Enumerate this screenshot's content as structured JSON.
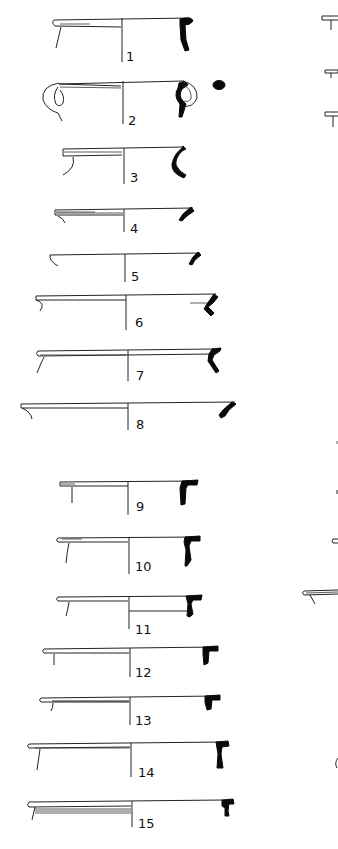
{
  "figure": {
    "type": "archaeological rim-profile plate",
    "background": "#ffffff",
    "ink": "#0a0a0a"
  },
  "profiles": [
    {
      "number": "1",
      "rim_y": 21,
      "left_x": 52,
      "axis_x": 122,
      "right_x": 192,
      "label_y": 57
    },
    {
      "number": "2",
      "rim_y": 83,
      "left_x": 58,
      "axis_x": 123,
      "right_x": 183,
      "label_y": 124,
      "has_handle": true,
      "handle_section": "oval"
    },
    {
      "number": "3",
      "rim_y": 148,
      "left_x": 62,
      "axis_x": 124,
      "right_x": 183,
      "label_y": 180
    },
    {
      "number": "4",
      "rim_y": 209,
      "left_x": 54,
      "axis_x": 124,
      "right_x": 193,
      "label_y": 230
    },
    {
      "number": "5",
      "rim_y": 254,
      "left_x": 48,
      "axis_x": 125,
      "right_x": 200,
      "label_y": 278
    },
    {
      "number": "6",
      "rim_y": 295,
      "left_x": 35,
      "axis_x": 126,
      "right_x": 217,
      "label_y": 324
    },
    {
      "number": "7",
      "rim_y": 351,
      "left_x": 36,
      "axis_x": 128,
      "right_x": 216,
      "label_y": 376
    },
    {
      "number": "8",
      "rim_y": 403,
      "left_x": 20,
      "axis_x": 128,
      "right_x": 235,
      "label_y": 426
    },
    {
      "number": "9",
      "rim_y": 481,
      "left_x": 59,
      "axis_x": 128,
      "right_x": 196,
      "label_y": 508
    },
    {
      "number": "10",
      "rim_y": 537,
      "left_x": 57,
      "axis_x": 129,
      "right_x": 199,
      "label_y": 568
    },
    {
      "number": "11",
      "rim_y": 596,
      "left_x": 57,
      "axis_x": 129,
      "right_x": 200,
      "label_y": 630
    },
    {
      "number": "12",
      "rim_y": 648,
      "left_x": 43,
      "axis_x": 130,
      "right_x": 216,
      "label_y": 672
    },
    {
      "number": "13",
      "rim_y": 697,
      "left_x": 40,
      "axis_x": 130,
      "right_x": 218,
      "label_y": 720
    },
    {
      "number": "14",
      "rim_y": 743,
      "left_x": 28,
      "axis_x": 131,
      "right_x": 223,
      "label_y": 774
    },
    {
      "number": "15",
      "rim_y": 801,
      "left_x": 28,
      "axis_x": 132,
      "right_x": 223,
      "label_y": 824
    }
  ],
  "right_column_fragments": [
    {
      "y": 21,
      "kind": "T-rim"
    },
    {
      "y": 71,
      "kind": "T-rim"
    },
    {
      "y": 113,
      "kind": "T-rim"
    },
    {
      "y": 441,
      "kind": "tick"
    },
    {
      "y": 491,
      "kind": "tick"
    },
    {
      "y": 541,
      "kind": "loop"
    },
    {
      "y": 593,
      "kind": "rim"
    },
    {
      "y": 763,
      "kind": "arc"
    }
  ]
}
